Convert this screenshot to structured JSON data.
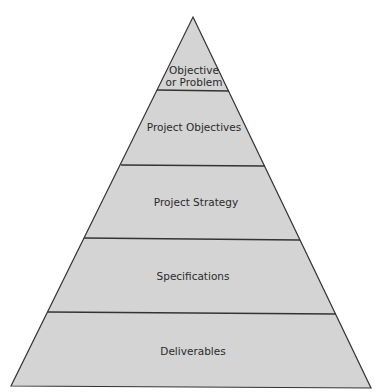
{
  "diagram": {
    "type": "pyramid",
    "fill_color": "#d4d4d4",
    "stroke_color": "#333333",
    "levels": [
      {
        "label_lines": [
          "Objective",
          "or Problem"
        ]
      },
      {
        "label_lines": [
          "Project Objectives"
        ]
      },
      {
        "label_lines": [
          "Project Strategy"
        ]
      },
      {
        "label_lines": [
          "Specifications"
        ]
      },
      {
        "label_lines": [
          "Deliverables"
        ]
      }
    ]
  }
}
